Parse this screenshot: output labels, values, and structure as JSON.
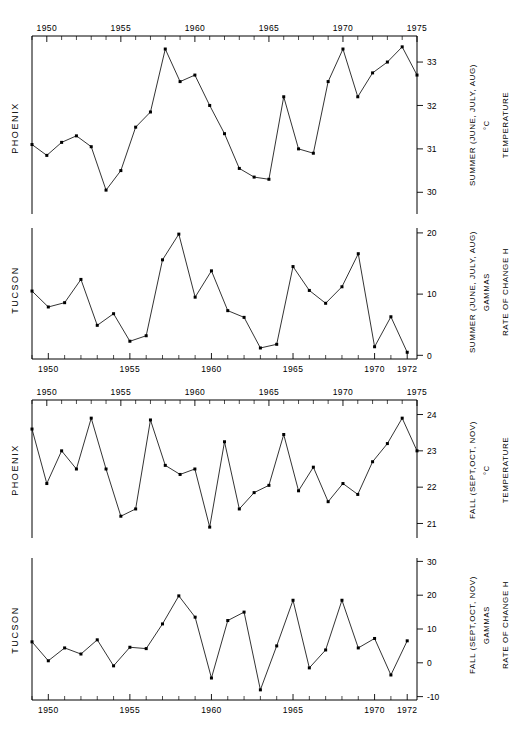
{
  "figure": {
    "width": 528,
    "height": 731,
    "background": "#ffffff",
    "ink_color": "#000000"
  },
  "chart_data": [
    {
      "id": "panel-1",
      "type": "line",
      "title": "",
      "left_label": "PHOENIX",
      "right_label_primary": "SUMMER (JUNE, JULY, AUG)",
      "right_label_unit": "°C",
      "right_label_secondary": "TEMPERATURE",
      "xlabel": "",
      "ylabel": "TEMPERATURE",
      "axis_position": "top",
      "grid": false,
      "legend": "none",
      "xlim": [
        1949,
        1975
      ],
      "ylim": [
        29.5,
        33.6
      ],
      "xticks": [
        1950,
        1955,
        1960,
        1965,
        1970,
        1975
      ],
      "xtick_labels": [
        "1950",
        "1955",
        "1960",
        "1965",
        "1970",
        "1975"
      ],
      "xtick_minor_step": 1,
      "yticks": [
        30,
        31,
        32,
        33
      ],
      "ytick_labels": [
        "30",
        "31",
        "32",
        "33"
      ],
      "x": [
        1949,
        1950,
        1951,
        1952,
        1953,
        1954,
        1955,
        1956,
        1957,
        1958,
        1959,
        1960,
        1961,
        1962,
        1963,
        1964,
        1965,
        1966,
        1967,
        1968,
        1969,
        1970,
        1971,
        1972,
        1973,
        1974,
        1975
      ],
      "values": [
        31.1,
        30.85,
        31.15,
        31.3,
        31.05,
        30.05,
        30.5,
        31.5,
        31.85,
        33.3,
        32.55,
        32.7,
        32.0,
        31.35,
        30.55,
        30.35,
        30.3,
        32.2,
        31.0,
        30.9,
        32.55,
        33.3,
        32.2,
        32.75,
        33.0,
        33.35,
        32.7
      ]
    },
    {
      "id": "panel-2",
      "type": "line",
      "title": "",
      "left_label": "TUCSON",
      "right_label_primary": "SUMMER (JUNE, JULY, AUG)",
      "right_label_unit": "GAMMAS",
      "right_label_secondary": "RATE OF CHANGE  H",
      "xlabel": "",
      "ylabel": "RATE OF CHANGE H",
      "axis_position": "bottom",
      "grid": false,
      "legend": "none",
      "xlim": [
        1949,
        1972.6
      ],
      "ylim": [
        -0.6,
        20.8
      ],
      "xticks": [
        1950,
        1955,
        1960,
        1965,
        1970,
        1972
      ],
      "xtick_labels": [
        "1950",
        "1955",
        "1960",
        "1965",
        "1970",
        "1972"
      ],
      "xtick_minor_step": 1,
      "yticks": [
        0,
        10,
        20
      ],
      "ytick_labels": [
        "0",
        "10",
        "20"
      ],
      "x": [
        1949,
        1950,
        1951,
        1952,
        1953,
        1954,
        1955,
        1956,
        1957,
        1958,
        1959,
        1960,
        1961,
        1962,
        1963,
        1964,
        1965,
        1966,
        1967,
        1968,
        1969,
        1970,
        1971,
        1972
      ],
      "values": [
        10.5,
        7.9,
        8.6,
        12.4,
        4.9,
        6.8,
        2.3,
        3.2,
        15.6,
        19.8,
        9.5,
        13.8,
        7.3,
        6.2,
        1.2,
        1.8,
        14.5,
        10.6,
        8.5,
        11.2,
        16.6,
        1.4,
        6.3,
        0.5,
        20.1,
        9.3
      ]
    },
    {
      "id": "panel-3",
      "type": "line",
      "title": "",
      "left_label": "PHOENIX",
      "right_label_primary": "FALL (SEPT,OCT, NOV)",
      "right_label_unit": "°C",
      "right_label_secondary": "TEMPERATURE",
      "xlabel": "",
      "ylabel": "TEMPERATURE",
      "axis_position": "top",
      "grid": false,
      "legend": "none",
      "xlim": [
        1949,
        1975
      ],
      "ylim": [
        20.6,
        24.4
      ],
      "xticks": [
        1950,
        1955,
        1960,
        1965,
        1970,
        1975
      ],
      "xtick_labels": [
        "1950",
        "1955",
        "1960",
        "1965",
        "1970",
        "1975"
      ],
      "xtick_minor_step": 1,
      "yticks": [
        21,
        22,
        23,
        24
      ],
      "ytick_labels": [
        "21",
        "22",
        "23",
        "24"
      ],
      "x": [
        1949,
        1950,
        1951,
        1952,
        1953,
        1954,
        1955,
        1956,
        1957,
        1958,
        1959,
        1960,
        1961,
        1962,
        1963,
        1964,
        1965,
        1966,
        1967,
        1968,
        1969,
        1970,
        1971,
        1972,
        1973,
        1974,
        1975
      ],
      "values": [
        23.6,
        22.1,
        23.0,
        22.5,
        23.9,
        22.5,
        21.2,
        21.4,
        23.85,
        22.6,
        22.35,
        22.5,
        20.9,
        23.25,
        21.4,
        21.85,
        22.05,
        23.45,
        21.9,
        22.55,
        21.6,
        22.1,
        21.8,
        22.7,
        23.2,
        23.9,
        23.0
      ]
    },
    {
      "id": "panel-4",
      "type": "line",
      "title": "",
      "left_label": "TUCSON",
      "right_label_primary": "FALL (SEPT,OCT, NOV)",
      "right_label_unit": "GAMMAS",
      "right_label_secondary": "RATE OF CHANGE  H",
      "xlabel": "",
      "ylabel": "RATE OF CHANGE H",
      "axis_position": "bottom",
      "grid": false,
      "legend": "none",
      "xlim": [
        1949,
        1972.6
      ],
      "ylim": [
        -11,
        31
      ],
      "xticks": [
        1950,
        1955,
        1960,
        1965,
        1970,
        1972
      ],
      "xtick_labels": [
        "1950",
        "1955",
        "1960",
        "1965",
        "1970",
        "1972"
      ],
      "xtick_minor_step": 1,
      "yticks": [
        30,
        20,
        10,
        0,
        -10
      ],
      "ytick_labels": [
        "30",
        "20",
        "10",
        "0",
        "-10"
      ],
      "x": [
        1949,
        1950,
        1951,
        1952,
        1953,
        1954,
        1955,
        1956,
        1957,
        1958,
        1959,
        1960,
        1961,
        1962,
        1963,
        1964,
        1965,
        1966,
        1967,
        1968,
        1969,
        1970,
        1971,
        1972
      ],
      "values": [
        6.2,
        0.6,
        4.4,
        2.6,
        6.8,
        -0.9,
        4.6,
        4.2,
        11.5,
        19.8,
        13.5,
        -4.5,
        12.5,
        15.0,
        -8.0,
        5.0,
        18.5,
        -1.5,
        3.8,
        18.5,
        4.4,
        7.2,
        -3.6,
        6.5
      ]
    }
  ]
}
